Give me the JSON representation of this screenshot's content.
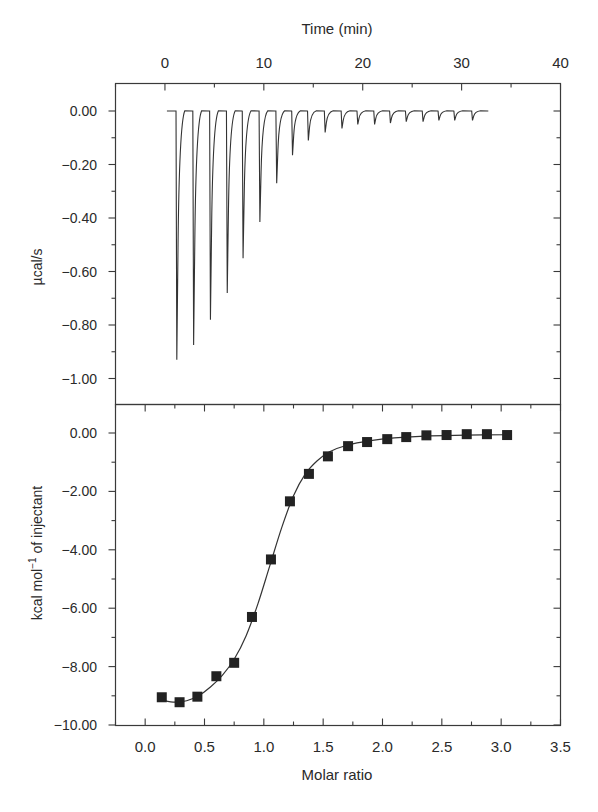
{
  "chart_data": [
    {
      "type": "line",
      "panel": "top",
      "title": "",
      "xlabel": "Time (min)",
      "ylabel": "µcal/s",
      "xlim": [
        -5,
        40
      ],
      "ylim": [
        -1.1,
        0.1
      ],
      "x_ticks": [
        0,
        10,
        20,
        30,
        40
      ],
      "x_tick_labels": [
        "0",
        "10",
        "20",
        "30",
        "40"
      ],
      "x_axis_position": "top",
      "y_ticks": [
        0.0,
        -0.2,
        -0.4,
        -0.6,
        -0.8,
        -1.0
      ],
      "y_tick_labels": [
        "0.00",
        "−0.20",
        "−0.40",
        "−0.60",
        "−0.80",
        "−1.00"
      ],
      "grid": false,
      "baseline": {
        "start_min": 0.2,
        "end_min": 32.7,
        "value": 0.0
      },
      "series": [
        {
          "name": "Raw ITC thermogram (injection peaks)",
          "injection_times_min": [
            1.2,
            2.9,
            4.6,
            6.3,
            7.9,
            9.6,
            11.3,
            12.9,
            14.5,
            16.2,
            17.9,
            19.5,
            21.2,
            22.8,
            24.4,
            26.1,
            27.7,
            29.3,
            31.1
          ],
          "peak_values": [
            -0.93,
            -0.875,
            -0.78,
            -0.68,
            -0.55,
            -0.415,
            -0.27,
            -0.165,
            -0.11,
            -0.08,
            -0.065,
            -0.05,
            -0.05,
            -0.045,
            -0.04,
            -0.04,
            -0.035,
            -0.035,
            -0.035
          ]
        }
      ]
    },
    {
      "type": "scatter",
      "panel": "bottom",
      "title": "",
      "xlabel": "Molar ratio",
      "ylabel": "kcal mol⁻¹ of injectant",
      "xlim": [
        -0.25,
        3.5
      ],
      "ylim": [
        -10.0,
        1.0
      ],
      "x_ticks": [
        0.0,
        0.5,
        1.0,
        1.5,
        2.0,
        2.5,
        3.0,
        3.5
      ],
      "x_tick_labels": [
        "0.0",
        "0.5",
        "1.0",
        "1.5",
        "2.0",
        "2.5",
        "3.0",
        "3.5"
      ],
      "y_ticks": [
        0.0,
        -2.0,
        -4.0,
        -6.0,
        -8.0,
        -10.0
      ],
      "y_tick_labels": [
        "0.00",
        "−2.00",
        "−4.00",
        "−6.00",
        "−8.00",
        "−10.00"
      ],
      "grid": false,
      "series": [
        {
          "name": "Integrated heats (squares)",
          "marker": "square",
          "x": [
            0.14,
            0.29,
            0.44,
            0.6,
            0.75,
            0.9,
            1.06,
            1.22,
            1.38,
            1.54,
            1.71,
            1.87,
            2.04,
            2.2,
            2.37,
            2.54,
            2.71,
            2.88,
            3.05
          ],
          "y": [
            -9.05,
            -9.22,
            -9.03,
            -8.33,
            -7.87,
            -6.3,
            -4.33,
            -2.34,
            -1.4,
            -0.8,
            -0.45,
            -0.31,
            -0.21,
            -0.14,
            -0.08,
            -0.07,
            -0.04,
            -0.04,
            -0.07
          ]
        },
        {
          "name": "Fitted binding isotherm",
          "type": "line",
          "x": [
            0.14,
            0.25,
            0.35,
            0.45,
            0.55,
            0.65,
            0.75,
            0.85,
            0.95,
            1.05,
            1.15,
            1.25,
            1.35,
            1.45,
            1.55,
            1.7,
            1.9,
            2.1,
            2.4,
            2.7,
            3.05
          ],
          "y": [
            -9.15,
            -9.22,
            -9.17,
            -9.0,
            -8.7,
            -8.3,
            -7.75,
            -6.95,
            -5.85,
            -4.55,
            -3.25,
            -2.15,
            -1.4,
            -0.95,
            -0.65,
            -0.42,
            -0.26,
            -0.17,
            -0.1,
            -0.07,
            -0.06
          ]
        }
      ]
    }
  ],
  "labels": {
    "top_xlabel": "Time (min)",
    "top_ylabel": "µcal/s",
    "bottom_xlabel": "Molar ratio",
    "bottom_ylabel_main": "kcal mol",
    "bottom_ylabel_sup": "−1",
    "bottom_ylabel_tail": " of injectant"
  },
  "colors": {
    "axis": "#3a3a3a",
    "trace": "#333333",
    "marker": "#222222",
    "background": "#ffffff"
  }
}
